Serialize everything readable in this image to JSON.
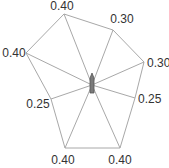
{
  "chart_data": {
    "type": "radar",
    "title": "",
    "axes": 8,
    "values": [
      0.4,
      0.3,
      0.3,
      0.25,
      0.4,
      0.4,
      0.25,
      0.4
    ],
    "labels": [
      "0.40",
      "0.30",
      "0.30",
      "0.25",
      "0.40",
      "0.40",
      "0.25",
      "0.40"
    ],
    "grid": false,
    "legend": null
  },
  "style": {
    "line_color": "#a8a8a8",
    "marker_color": "#7a7a7a",
    "text_color": "#333333"
  },
  "geometry": {
    "center": [
      92,
      85
    ],
    "vertices": [
      [
        64,
        14
      ],
      [
        113,
        30
      ],
      [
        144,
        62
      ],
      [
        135,
        98
      ],
      [
        120,
        148
      ],
      [
        65,
        148
      ],
      [
        51,
        99
      ],
      [
        26,
        53
      ]
    ],
    "label_pos": [
      [
        62,
        10,
        "middle"
      ],
      [
        122,
        23,
        "middle"
      ],
      [
        147,
        67,
        "start"
      ],
      [
        138,
        103,
        "start"
      ],
      [
        120,
        164,
        "middle"
      ],
      [
        63,
        164,
        "middle"
      ],
      [
        38,
        108,
        "middle"
      ],
      [
        14,
        57,
        "middle"
      ]
    ]
  }
}
